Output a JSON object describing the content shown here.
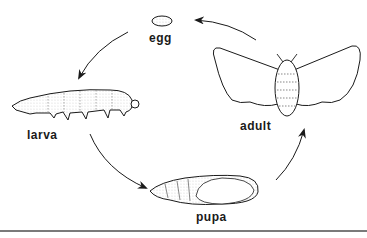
{
  "diagram": {
    "type": "life-cycle",
    "stages": [
      {
        "id": "egg",
        "label": "egg"
      },
      {
        "id": "larva",
        "label": "larva"
      },
      {
        "id": "pupa",
        "label": "pupa"
      },
      {
        "id": "adult",
        "label": "adult"
      }
    ],
    "flow": [
      "egg -> larva",
      "larva -> pupa",
      "pupa -> adult",
      "adult -> egg"
    ],
    "colors": {
      "line": "#1a1a1a",
      "rule": "#7a7a7a",
      "background": "#ffffff"
    }
  }
}
